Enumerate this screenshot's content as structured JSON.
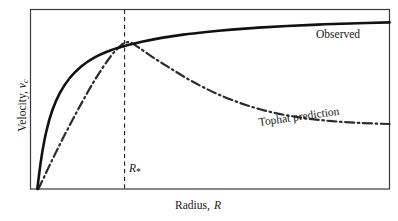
{
  "figure": {
    "background_color": "#ffffff",
    "frame_color": "#3a3a3a",
    "ink_color": "#171717"
  },
  "axis_labels": {
    "x_prefix": "Radius,",
    "x_symbol": "R",
    "y_prefix": "Velocity,",
    "y_symbol": "v",
    "y_symbol_sub": "c"
  },
  "annotations": {
    "observed": "Observed",
    "tophat": "Tophat prediction",
    "rstar_symbol": "R",
    "rstar_sub": "*"
  },
  "chart_data": {
    "type": "line",
    "title": "",
    "xlabel": "Radius, R",
    "ylabel": "Velocity, v_c",
    "grid": false,
    "legend": "inline-annotations",
    "axis_ticks": "none",
    "xlim": [
      0,
      1
    ],
    "ylim": [
      0,
      1
    ],
    "marker_lines": [
      {
        "name": "R_star",
        "label": "R*",
        "orientation": "vertical",
        "x": 0.262,
        "style": "dashed",
        "color": "#262626"
      }
    ],
    "series": [
      {
        "name": "Observed",
        "style": "solid",
        "color": "#111111",
        "width": 2.6,
        "description": "Flat rotation curve: rises steeply then asymptotes to a constant velocity.",
        "x": [
          0.019,
          0.03,
          0.044,
          0.061,
          0.083,
          0.11,
          0.142,
          0.18,
          0.222,
          0.262,
          0.31,
          0.365,
          0.425,
          0.49,
          0.56,
          0.635,
          0.715,
          0.8,
          0.89,
          1.0
        ],
        "y": [
          0.0,
          0.17,
          0.32,
          0.44,
          0.54,
          0.62,
          0.684,
          0.735,
          0.772,
          0.797,
          0.82,
          0.842,
          0.86,
          0.875,
          0.888,
          0.899,
          0.908,
          0.916,
          0.922,
          0.928
        ]
      },
      {
        "name": "Tophat prediction",
        "style": "dash-dot",
        "color": "#2b2b2b",
        "width": 2.2,
        "description": "Rises almost linearly to a peak at R*, then falls off Keplerian-like.",
        "x": [
          0.022,
          0.06,
          0.1,
          0.14,
          0.18,
          0.22,
          0.252,
          0.275,
          0.3,
          0.34,
          0.39,
          0.45,
          0.52,
          0.6,
          0.68,
          0.76,
          0.84,
          0.92,
          1.0
        ],
        "y": [
          0.0,
          0.16,
          0.32,
          0.47,
          0.61,
          0.73,
          0.8,
          0.818,
          0.79,
          0.735,
          0.672,
          0.6,
          0.53,
          0.468,
          0.424,
          0.396,
          0.378,
          0.368,
          0.362
        ]
      }
    ]
  }
}
